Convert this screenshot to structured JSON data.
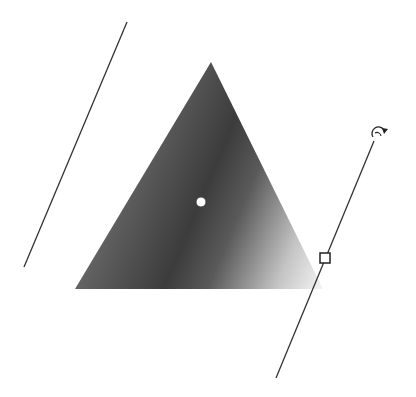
{
  "canvas": {
    "width": 416,
    "height": 397,
    "background": "#ffffff"
  },
  "shape": {
    "type": "triangle",
    "points": [
      [
        211,
        62
      ],
      [
        75,
        289
      ],
      [
        323,
        289
      ]
    ],
    "gradient": {
      "type": "reflected-linear",
      "center_color": "#3c3c3c",
      "left_edge_color": "#7a7a7a",
      "right_edge_color": "#f2f2f2"
    }
  },
  "gradient_tool": {
    "center_handle": {
      "x": 201,
      "y": 202,
      "r": 5,
      "fill": "#ffffff"
    },
    "left_boundary_line": {
      "x1": 127,
      "y1": 22,
      "x2": 24,
      "y2": 267
    },
    "right_boundary_line": {
      "x1": 374,
      "y1": 141,
      "x2": 276,
      "y2": 378
    },
    "width_handle": {
      "x": 325,
      "y": 258,
      "size": 10
    },
    "rotate_handle": {
      "x": 379,
      "y": 133,
      "r": 7,
      "icon": "rotate-icon"
    }
  }
}
